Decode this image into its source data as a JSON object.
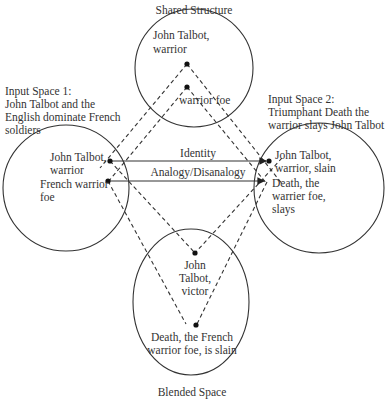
{
  "diagram": {
    "type": "conceptual-blending",
    "spaces": {
      "shared": {
        "title": "Shared Structure",
        "elements": [
          "John Talbot,",
          "warrior",
          "warrior foe"
        ]
      },
      "input1": {
        "title_line1": "Input Space 1:",
        "title_line2": "John Talbot and the",
        "title_line3": "English dominate French",
        "title_line4": "soldiers",
        "elem1_line1": "John Talbot,",
        "elem1_line2": "warrior",
        "elem2_line1": "French warrior",
        "elem2_line2": "foe"
      },
      "input2": {
        "title_line1": "Input Space 2:",
        "title_line2": "Triumphant Death the",
        "title_line3": "warrior slays John Talbot",
        "elem1_line1": "John Talbot,",
        "elem1_line2": "warrior, slain",
        "elem2_line1": "Death, the",
        "elem2_line2": "warrier foe,",
        "elem2_line3": "slays"
      },
      "blended": {
        "title": "Blended Space",
        "elem1_line1": "John",
        "elem1_line2": "Talbot,",
        "elem1_line3": "victor",
        "elem2_line1": "Death, the French",
        "elem2_line2": "warrior foe, is slain"
      }
    },
    "connections": {
      "identity": "Identity",
      "analogy": "Analogy/Disanalogy"
    },
    "colors": {
      "stroke": "#333333",
      "text": "#333333",
      "background": "#ffffff"
    }
  }
}
